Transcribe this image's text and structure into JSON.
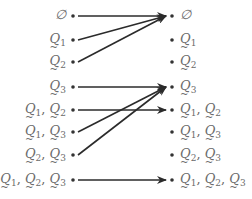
{
  "diagram": {
    "left_nodes": [
      {
        "id": "L0",
        "label": "∅",
        "y": 16
      },
      {
        "id": "L1",
        "label": "Q1",
        "y": 40
      },
      {
        "id": "L2",
        "label": "Q2",
        "y": 62
      },
      {
        "id": "L3",
        "label": "Q3",
        "y": 87
      },
      {
        "id": "L4",
        "label": "Q1, Q2",
        "y": 110
      },
      {
        "id": "L5",
        "label": "Q1, Q3",
        "y": 132
      },
      {
        "id": "L6",
        "label": "Q2, Q3",
        "y": 155
      },
      {
        "id": "L7",
        "label": "Q1, Q2, Q3",
        "y": 180
      }
    ],
    "right_nodes": [
      {
        "id": "R0",
        "label": "∅",
        "y": 16
      },
      {
        "id": "R1",
        "label": "Q1",
        "y": 40
      },
      {
        "id": "R2",
        "label": "Q2",
        "y": 62
      },
      {
        "id": "R3",
        "label": "Q3",
        "y": 87
      },
      {
        "id": "R4",
        "label": "Q1, Q2",
        "y": 110
      },
      {
        "id": "R5",
        "label": "Q1, Q3",
        "y": 132
      },
      {
        "id": "R6",
        "label": "Q2, Q3",
        "y": 155
      },
      {
        "id": "R7",
        "label": "Q1, Q2, Q3",
        "y": 180
      }
    ],
    "edges": [
      {
        "from": "L0",
        "to": "R0"
      },
      {
        "from": "L1",
        "to": "R0"
      },
      {
        "from": "L2",
        "to": "R0"
      },
      {
        "from": "L3",
        "to": "R3"
      },
      {
        "from": "L4",
        "to": "R4"
      },
      {
        "from": "L5",
        "to": "R3"
      },
      {
        "from": "L6",
        "to": "R3"
      },
      {
        "from": "L7",
        "to": "R7"
      }
    ],
    "colors": {
      "text": "#6b6b6b",
      "edge": "#2b2b2b",
      "dot": "#333333"
    }
  }
}
